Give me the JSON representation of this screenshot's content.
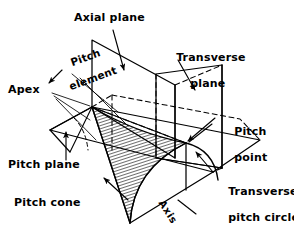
{
  "figure": {
    "type": "engineering-line-diagram",
    "background_color": "#ffffff",
    "line_color": "#000000"
  },
  "labels": {
    "axial_plane": "Axial plane",
    "transverse_plane_l1": "Transverse",
    "transverse_plane_l2": "plane",
    "pitch_element_l1": "Pitch",
    "pitch_element_l2": "element",
    "apex": "Apex",
    "pitch_point_l1": "Pitch",
    "pitch_point_l2": "point",
    "pitch_plane": "Pitch plane",
    "pitch_cone": "Pitch cone",
    "transverse_pitch_circle_l1": "Transverse",
    "transverse_pitch_circle_l2": "pitch circle",
    "axis": "Axis"
  },
  "geometry": {
    "apex_point": [
      92,
      107
    ],
    "pitch_point": [
      186,
      143
    ],
    "cone_bottom_vertex": [
      130,
      223
    ],
    "pitch_plane_quad": [
      [
        50,
        130
      ],
      [
        92,
        107
      ],
      [
        260,
        140
      ],
      [
        213,
        172
      ]
    ],
    "axial_plane_quad": [
      [
        92,
        40
      ],
      [
        175,
        85
      ],
      [
        175,
        158
      ],
      [
        92,
        107
      ]
    ],
    "transverse_plane_quad": [
      [
        156,
        74
      ],
      [
        222,
        65
      ],
      [
        222,
        168
      ],
      [
        156,
        158
      ]
    ]
  }
}
